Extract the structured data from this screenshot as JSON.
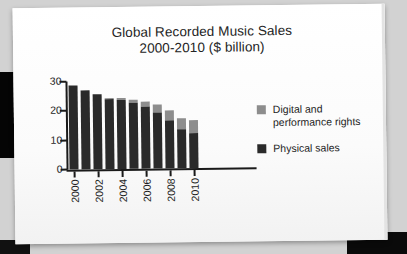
{
  "chart_data": {
    "type": "bar",
    "subtype": "stacked-bar",
    "title": "Global Recorded Music Sales",
    "subtitle": "2000-2010 ($ billion)",
    "xlabel": "",
    "ylabel": "",
    "ylim": [
      0,
      30
    ],
    "yticks": [
      0,
      10,
      20,
      30
    ],
    "grid": false,
    "legend_position": "right",
    "categories": [
      "2000",
      "2001",
      "2002",
      "2003",
      "2004",
      "2005",
      "2006",
      "2007",
      "2008",
      "2009",
      "2010"
    ],
    "xtick_labels": [
      "2000",
      "2002",
      "2004",
      "2006",
      "2008",
      "2010"
    ],
    "series": [
      {
        "name": "Physical sales",
        "color": "#2a2a2a",
        "values": [
          28.5,
          27.0,
          25.7,
          23.8,
          23.5,
          22.5,
          21.0,
          19.2,
          16.2,
          13.2,
          12.0
        ]
      },
      {
        "name": "Digital and performance rights",
        "color": "#8d8d8d",
        "values": [
          0.0,
          0.0,
          0.0,
          0.3,
          0.6,
          1.1,
          1.7,
          2.6,
          3.5,
          3.9,
          4.5
        ]
      }
    ],
    "totals": [
      28.5,
      27.0,
      25.7,
      24.1,
      24.1,
      23.6,
      22.7,
      21.8,
      19.7,
      17.1,
      16.5
    ]
  },
  "legend": {
    "items": [
      {
        "label_line1": "Digital and",
        "label_line2": "performance rights",
        "color": "#8d8d8d"
      },
      {
        "label_line1": "Physical sales",
        "label_line2": "",
        "color": "#2a2a2a"
      }
    ]
  },
  "colors": {
    "page": "#fdfdfd",
    "backdrop": "#d2d2d2",
    "axis": "#1a1a1a",
    "text": "#232323"
  }
}
